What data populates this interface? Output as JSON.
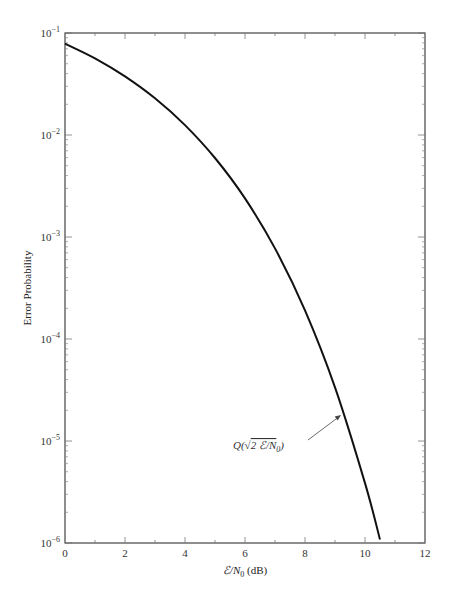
{
  "chart_data": {
    "type": "line",
    "title": "",
    "xlabel": "ℰ/N₀ (dB)",
    "ylabel": "Error Probability",
    "xlim": [
      0,
      12
    ],
    "ylim": [
      1e-06,
      0.1
    ],
    "yscale": "log",
    "grid": false,
    "x_ticks": [
      0,
      2,
      4,
      6,
      8,
      10,
      12
    ],
    "x_tick_labels": [
      "0",
      "2",
      "4",
      "6",
      "8",
      "10",
      "12"
    ],
    "y_ticks": [
      0.1,
      0.01,
      0.001,
      0.0001,
      1e-05,
      1e-06
    ],
    "y_tick_labels": [
      {
        "base": "10",
        "exp": "−1"
      },
      {
        "base": "10",
        "exp": "−2"
      },
      {
        "base": "10",
        "exp": "−3"
      },
      {
        "base": "10",
        "exp": "−4"
      },
      {
        "base": "10",
        "exp": "−5"
      },
      {
        "base": "10",
        "exp": "−6"
      }
    ],
    "series": [
      {
        "name": "Q(√(2ℰ/N₀))",
        "x": [
          0,
          1,
          2,
          3,
          4,
          5,
          6,
          7,
          8,
          9,
          10,
          10.5
        ],
        "y": [
          0.0786,
          0.0563,
          0.0375,
          0.0229,
          0.0125,
          0.00595,
          0.00239,
          0.000773,
          0.000191,
          3.36e-05,
          3.87e-06,
          1.08e-06
        ]
      }
    ],
    "annotations": [
      {
        "text": "Q(√2ℰ/N₀)",
        "arrow_to_x": 9.2,
        "arrow_to_y": 1.8e-05
      }
    ]
  },
  "labels": {
    "ylabel": "Error Probability",
    "xlabel_main": "ℰ/N",
    "xlabel_sub": "0",
    "xlabel_unit": " (dB)",
    "annot_q": "Q(",
    "annot_sqrt": "√",
    "annot_inner": "2 ℰ/N",
    "annot_sub": "0",
    "annot_close": ")"
  }
}
